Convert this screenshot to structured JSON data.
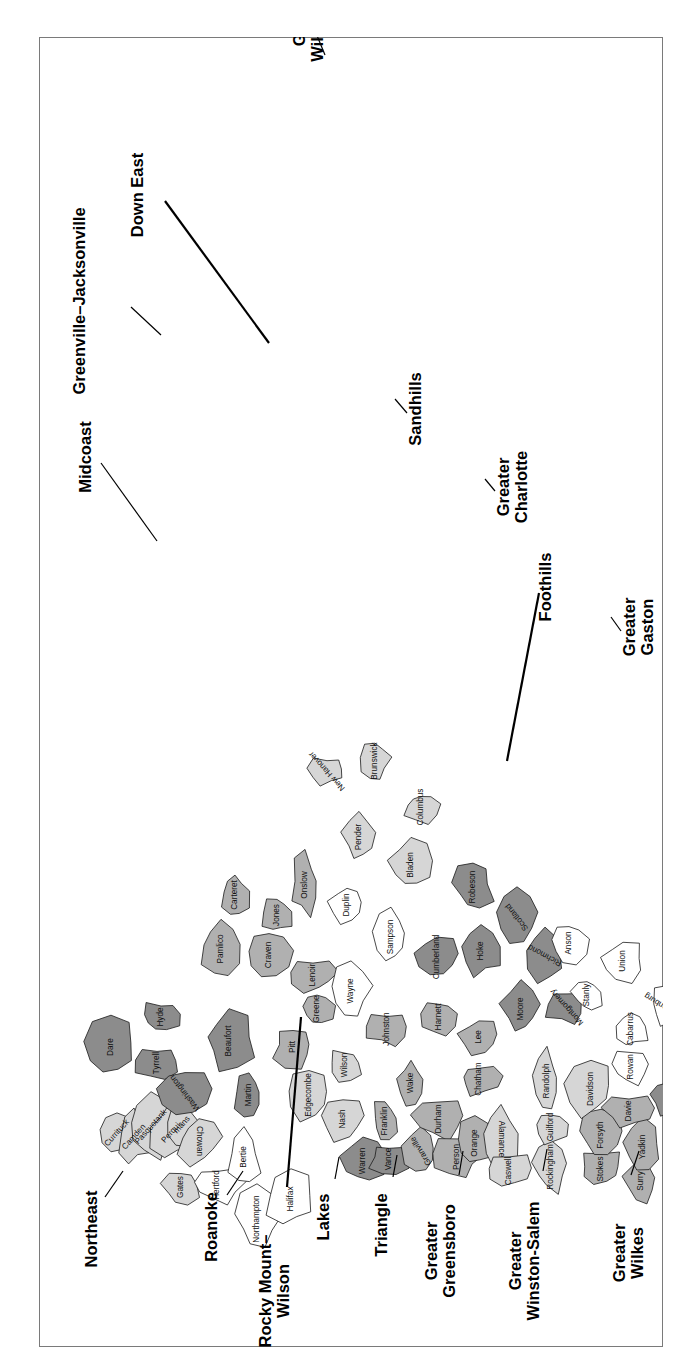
{
  "figure": {
    "kind": "choropleth-region-map",
    "orientation_degrees": -90,
    "frame_border_color": "#7a7a7a"
  },
  "palette": {
    "white": "#ffffff",
    "light_gray": "#d6d6d6",
    "medium_gray": "#b0b0b0",
    "dark_gray": "#8c8c8c",
    "darkest_gray": "#7a7a7a",
    "outline": "#1a1a1a",
    "text": "#111111"
  },
  "regions": [
    {
      "id": "northeast",
      "label": "Northeast",
      "label_x": 118,
      "label_y": 58,
      "leader": [
        [
          150,
          66
        ],
        [
          176,
          84
        ]
      ],
      "tone": "light_gray"
    },
    {
      "id": "midcoast",
      "label": "Midcoast",
      "label_x": 890,
      "label_y": 52,
      "leader": [
        [
          884,
          62
        ],
        [
          806,
          118
        ]
      ],
      "tone": "dark_gray"
    },
    {
      "id": "greenville-jacksonville",
      "label": "Greenville–Jacksonville",
      "label_x": 1046,
      "label_y": 46,
      "leader": [
        [
          1040,
          92
        ],
        [
          1012,
          122
        ]
      ],
      "tone": "medium_gray"
    },
    {
      "id": "down-east",
      "label": "Down East",
      "label_x": 1152,
      "label_y": 104,
      "leader": [
        [
          1146,
          126
        ],
        [
          1004,
          230
        ]
      ],
      "tone": "medium_gray"
    },
    {
      "id": "greater-wilmington",
      "label": "Greater Wilmington",
      "label_x": 1330,
      "label_y": 266,
      "leader": [
        [
          1326,
          272
        ],
        [
          1292,
          286
        ]
      ],
      "tone": "light_gray"
    },
    {
      "id": "roanoke",
      "label": "Roanoke",
      "label_x": 120,
      "label_y": 178,
      "leader": [
        [
          152,
          188
        ],
        [
          176,
          204
        ]
      ],
      "tone": "white"
    },
    {
      "id": "rocky-mount-wilson",
      "label": "Rocky Mount–Wilson",
      "label_x": 56,
      "label_y": 232,
      "leader": [
        [
          160,
          248
        ],
        [
          330,
          262
        ]
      ],
      "tone": "light_gray"
    },
    {
      "id": "lakes",
      "label": "Lakes",
      "label_x": 130,
      "label_y": 290,
      "leader": [
        [
          168,
          296
        ],
        [
          190,
          300
        ]
      ],
      "tone": "dark_gray"
    },
    {
      "id": "triangle",
      "label": "Triangle",
      "label_x": 122,
      "label_y": 348,
      "leader": [
        [
          170,
          354
        ],
        [
          192,
          358
        ]
      ],
      "tone": "medium_gray"
    },
    {
      "id": "greater-greensboro",
      "label": "Greater Greensboro",
      "label_x": 96,
      "label_y": 398,
      "leader": [
        [
          172,
          420
        ],
        [
          196,
          424
        ]
      ],
      "tone": "light_gray"
    },
    {
      "id": "greater-winston-salem",
      "label": "Greater Winston-Salem",
      "label_x": 86,
      "label_y": 482,
      "leader": [
        [
          176,
          504
        ],
        [
          198,
          508
        ]
      ],
      "tone": "medium_gray"
    },
    {
      "id": "greater-wilkes",
      "label": "Greater Wilkes",
      "label_x": 94,
      "label_y": 586,
      "leader": [
        [
          172,
          592
        ],
        [
          196,
          600
        ]
      ],
      "tone": "light_gray"
    },
    {
      "id": "greater-boone",
      "label": "Greater Boone",
      "label_x": 158,
      "label_y": 660,
      "leader": [
        [
          250,
          654
        ],
        [
          272,
          640
        ]
      ],
      "tone": "medium_gray"
    },
    {
      "id": "greater-mountain",
      "label": "Greater Mountain",
      "label_x": 242,
      "label_y": 708,
      "leader": [
        [
          346,
          700
        ],
        [
          360,
          690
        ]
      ],
      "tone": "medium_gray"
    },
    {
      "id": "highlands",
      "label": "Highlands",
      "label_x": 472,
      "label_y": 794,
      "leader": [
        [
          538,
          782
        ],
        [
          560,
          766
        ]
      ],
      "tone": "white"
    },
    {
      "id": "far-west",
      "label": "Far West",
      "label_x": 800,
      "label_y": 822,
      "leader": [
        [
          772,
          806
        ],
        [
          786,
          794
        ]
      ],
      "tone": "light_gray"
    },
    {
      "id": "greater-asheville",
      "label": "Greater Asheville",
      "label_x": 700,
      "label_y": 700,
      "leader": [
        [
          700,
          682
        ],
        [
          716,
          668
        ]
      ],
      "tone": "medium_gray"
    },
    {
      "id": "greater-gaston",
      "label": "Greater Gaston",
      "label_x": 720,
      "label_y": 596,
      "leader": [
        [
          716,
          582
        ],
        [
          730,
          572
        ]
      ],
      "tone": "light_gray"
    },
    {
      "id": "foothills",
      "label": "Foothills",
      "label_x": 760,
      "label_y": 512,
      "leader": [
        [
          754,
          500
        ],
        [
          586,
          468
        ]
      ],
      "tone": "medium_gray"
    },
    {
      "id": "greater-charlotte",
      "label": "Greater Charlotte",
      "label_x": 860,
      "label_y": 470,
      "leader": [
        [
          856,
          456
        ],
        [
          868,
          446
        ]
      ],
      "tone": "white"
    },
    {
      "id": "sandhills",
      "label": "Sandhills",
      "label_x": 938,
      "label_y": 382,
      "leader": [
        [
          934,
          368
        ],
        [
          948,
          356
        ]
      ],
      "tone": "dark_gray"
    }
  ],
  "counties": [
    {
      "n": "Currituck",
      "x": 214,
      "y": 78,
      "tone": "light_gray",
      "rot": 42
    },
    {
      "n": "Camden",
      "x": 210,
      "y": 95,
      "tone": "light_gray",
      "rot": 42
    },
    {
      "n": "Pasquotank",
      "x": 220,
      "y": 112,
      "tone": "light_gray",
      "rot": 42
    },
    {
      "n": "Perqui-",
      "x": 215,
      "y": 133,
      "tone": "light_gray",
      "rot": 42
    },
    {
      "n": "mans",
      "x": 222,
      "y": 143,
      "tone": "light_gray",
      "rot": 42
    },
    {
      "n": "Chowan",
      "x": 206,
      "y": 160,
      "tone": "light_gray",
      "rot": 180
    },
    {
      "n": "Gates",
      "x": 160,
      "y": 142,
      "tone": "light_gray",
      "rot": 0
    },
    {
      "n": "Hertford",
      "x": 162,
      "y": 178,
      "tone": "white",
      "rot": 0
    },
    {
      "n": "Bertie",
      "x": 190,
      "y": 205,
      "tone": "white",
      "rot": 0
    },
    {
      "n": "Northampton",
      "x": 128,
      "y": 218,
      "tone": "white",
      "rot": 0
    },
    {
      "n": "Halifax",
      "x": 148,
      "y": 252,
      "tone": "white",
      "rot": 0
    },
    {
      "n": "Dare",
      "x": 300,
      "y": 72,
      "tone": "dark_gray",
      "rot": 0
    },
    {
      "n": "Tyrrell",
      "x": 284,
      "y": 118,
      "tone": "dark_gray",
      "rot": 0
    },
    {
      "n": "Hyde",
      "x": 330,
      "y": 122,
      "tone": "dark_gray",
      "rot": 0
    },
    {
      "n": "Washington",
      "x": 254,
      "y": 146,
      "tone": "dark_gray",
      "rot": -38
    },
    {
      "n": "Beaufort",
      "x": 306,
      "y": 190,
      "tone": "dark_gray",
      "rot": 0
    },
    {
      "n": "Martin",
      "x": 252,
      "y": 210,
      "tone": "dark_gray",
      "rot": 0
    },
    {
      "n": "Pamlico",
      "x": 398,
      "y": 182,
      "tone": "medium_gray",
      "rot": 0
    },
    {
      "n": "Carteret",
      "x": 452,
      "y": 196,
      "tone": "medium_gray",
      "rot": 0
    },
    {
      "n": "Craven",
      "x": 392,
      "y": 230,
      "tone": "medium_gray",
      "rot": 0
    },
    {
      "n": "Jones",
      "x": 432,
      "y": 238,
      "tone": "medium_gray",
      "rot": 0
    },
    {
      "n": "Onslow",
      "x": 462,
      "y": 266,
      "tone": "medium_gray",
      "rot": 0
    },
    {
      "n": "Pitt",
      "x": 300,
      "y": 254,
      "tone": "medium_gray",
      "rot": 0
    },
    {
      "n": "Greene",
      "x": 338,
      "y": 278,
      "tone": "medium_gray",
      "rot": 0
    },
    {
      "n": "Lenoir",
      "x": 372,
      "y": 274,
      "tone": "medium_gray",
      "rot": 0
    },
    {
      "n": "Edgecombe",
      "x": 252,
      "y": 270,
      "tone": "light_gray",
      "rot": 0
    },
    {
      "n": "Nash",
      "x": 228,
      "y": 304,
      "tone": "light_gray",
      "rot": 0
    },
    {
      "n": "Wilson",
      "x": 282,
      "y": 306,
      "tone": "light_gray",
      "rot": 0
    },
    {
      "n": "Wayne",
      "x": 356,
      "y": 312,
      "tone": "white",
      "rot": 0
    },
    {
      "n": "Duplin",
      "x": 442,
      "y": 308,
      "tone": "white",
      "rot": 0
    },
    {
      "n": "Sampson",
      "x": 410,
      "y": 352,
      "tone": "white",
      "rot": 0
    },
    {
      "n": "Pender",
      "x": 510,
      "y": 320,
      "tone": "light_gray",
      "rot": 0
    },
    {
      "n": "New Hanover",
      "x": 576,
      "y": 288,
      "tone": "light_gray",
      "rot": -42
    },
    {
      "n": "Brunswick",
      "x": 586,
      "y": 336,
      "tone": "light_gray",
      "rot": 0
    },
    {
      "n": "Columbus",
      "x": 540,
      "y": 382,
      "tone": "light_gray",
      "rot": 0
    },
    {
      "n": "Bladen",
      "x": 482,
      "y": 372,
      "tone": "light_gray",
      "rot": 0
    },
    {
      "n": "Warren",
      "x": 186,
      "y": 324,
      "tone": "dark_gray",
      "rot": 0
    },
    {
      "n": "Vance",
      "x": 188,
      "y": 350,
      "tone": "dark_gray",
      "rot": 0
    },
    {
      "n": "Granville",
      "x": 196,
      "y": 382,
      "tone": "medium_gray",
      "rot": -32
    },
    {
      "n": "Franklin",
      "x": 226,
      "y": 346,
      "tone": "medium_gray",
      "rot": 0
    },
    {
      "n": "Johnston",
      "x": 318,
      "y": 348,
      "tone": "medium_gray",
      "rot": 0
    },
    {
      "n": "Wake",
      "x": 264,
      "y": 372,
      "tone": "medium_gray",
      "rot": 0
    },
    {
      "n": "Durham",
      "x": 228,
      "y": 400,
      "tone": "medium_gray",
      "rot": 0
    },
    {
      "n": "Person",
      "x": 190,
      "y": 418,
      "tone": "medium_gray",
      "rot": 0
    },
    {
      "n": "Orange",
      "x": 204,
      "y": 436,
      "tone": "medium_gray",
      "rot": 0
    },
    {
      "n": "Alamance",
      "x": 208,
      "y": 462,
      "tone": "light_gray",
      "rot": 180
    },
    {
      "n": "Chatham",
      "x": 268,
      "y": 440,
      "tone": "medium_gray",
      "rot": 0
    },
    {
      "n": "Harnett",
      "x": 330,
      "y": 400,
      "tone": "medium_gray",
      "rot": 0
    },
    {
      "n": "Lee",
      "x": 310,
      "y": 440,
      "tone": "medium_gray",
      "rot": 0
    },
    {
      "n": "Cumberland",
      "x": 390,
      "y": 398,
      "tone": "dark_gray",
      "rot": 0
    },
    {
      "n": "Hoke",
      "x": 396,
      "y": 442,
      "tone": "dark_gray",
      "rot": 0
    },
    {
      "n": "Robeson",
      "x": 460,
      "y": 434,
      "tone": "dark_gray",
      "rot": 0
    },
    {
      "n": "Scotland",
      "x": 430,
      "y": 478,
      "tone": "dark_gray",
      "rot": -38
    },
    {
      "n": "Moore",
      "x": 338,
      "y": 482,
      "tone": "dark_gray",
      "rot": 0
    },
    {
      "n": "Richmond",
      "x": 392,
      "y": 506,
      "tone": "dark_gray",
      "rot": -62
    },
    {
      "n": "Montgomery",
      "x": 340,
      "y": 528,
      "tone": "dark_gray",
      "rot": -42
    },
    {
      "n": "Caswell",
      "x": 176,
      "y": 470,
      "tone": "light_gray",
      "rot": 0
    },
    {
      "n": "Rockingham",
      "x": 180,
      "y": 512,
      "tone": "light_gray",
      "rot": 0
    },
    {
      "n": "Guilford",
      "x": 220,
      "y": 512,
      "tone": "light_gray",
      "rot": 0
    },
    {
      "n": "Randolph",
      "x": 266,
      "y": 508,
      "tone": "light_gray",
      "rot": 0
    },
    {
      "n": "Stokes",
      "x": 178,
      "y": 562,
      "tone": "medium_gray",
      "rot": 0
    },
    {
      "n": "Forsyth",
      "x": 212,
      "y": 562,
      "tone": "medium_gray",
      "rot": 0
    },
    {
      "n": "Davidson",
      "x": 258,
      "y": 552,
      "tone": "light_gray",
      "rot": 0
    },
    {
      "n": "Surry",
      "x": 166,
      "y": 602,
      "tone": "medium_gray",
      "rot": 0
    },
    {
      "n": "Yadkin",
      "x": 200,
      "y": 604,
      "tone": "medium_gray",
      "rot": 0
    },
    {
      "n": "Davie",
      "x": 236,
      "y": 590,
      "tone": "medium_gray",
      "rot": 0
    },
    {
      "n": "Rowan",
      "x": 280,
      "y": 592,
      "tone": "white",
      "rot": 0
    },
    {
      "n": "Stanly",
      "x": 352,
      "y": 548,
      "tone": "white",
      "rot": 0
    },
    {
      "n": "Anson",
      "x": 404,
      "y": 530,
      "tone": "white",
      "rot": 0
    },
    {
      "n": "Cabarrus",
      "x": 318,
      "y": 592,
      "tone": "white",
      "rot": 0
    },
    {
      "n": "Union",
      "x": 386,
      "y": 584,
      "tone": "white",
      "rot": 0
    },
    {
      "n": "Mecklenburg",
      "x": 340,
      "y": 626,
      "tone": "white",
      "rot": -58
    },
    {
      "n": "Alleghany",
      "x": 146,
      "y": 644,
      "tone": "light_gray",
      "rot": -42
    },
    {
      "n": "Wilkes",
      "x": 180,
      "y": 658,
      "tone": "light_gray",
      "rot": 0
    },
    {
      "n": "Ashe",
      "x": 140,
      "y": 684,
      "tone": "light_gray",
      "rot": 0
    },
    {
      "n": "Iredell",
      "x": 250,
      "y": 630,
      "tone": "dark_gray",
      "rot": 0
    },
    {
      "n": "Alexander",
      "x": 236,
      "y": 658,
      "tone": "dark_gray",
      "rot": -50
    },
    {
      "n": "Catawba",
      "x": 270,
      "y": 666,
      "tone": "dark_gray",
      "rot": 0
    },
    {
      "n": "Caldwell",
      "x": 226,
      "y": 700,
      "tone": "darkest_gray",
      "rot": 0
    },
    {
      "n": "Watauga",
      "x": 178,
      "y": 706,
      "tone": "medium_gray",
      "rot": 0
    },
    {
      "n": "Avery",
      "x": 202,
      "y": 734,
      "tone": "medium_gray",
      "rot": 0
    },
    {
      "n": "Lincoln",
      "x": 306,
      "y": 664,
      "tone": "light_gray",
      "rot": 0
    },
    {
      "n": "Gaston",
      "x": 336,
      "y": 666,
      "tone": "light_gray",
      "rot": 0
    },
    {
      "n": "Cleveland",
      "x": 344,
      "y": 700,
      "tone": "light_gray",
      "rot": 0
    },
    {
      "n": "Burke",
      "x": 268,
      "y": 714,
      "tone": "white",
      "rot": 0
    },
    {
      "n": "McDowell",
      "x": 282,
      "y": 756,
      "tone": "white",
      "rot": 0
    },
    {
      "n": "Rutherford",
      "x": 324,
      "y": 740,
      "tone": "light_gray",
      "rot": 0
    },
    {
      "n": "Polk",
      "x": 352,
      "y": 768,
      "tone": "light_gray",
      "rot": 0
    },
    {
      "n": "Mitchell",
      "x": 222,
      "y": 766,
      "tone": "white",
      "rot": 0
    },
    {
      "n": "Yancey",
      "x": 244,
      "y": 786,
      "tone": "white",
      "rot": 0
    },
    {
      "n": "Madison",
      "x": 238,
      "y": 822,
      "tone": "medium_gray",
      "rot": 0
    },
    {
      "n": "Buncombe",
      "x": 292,
      "y": 802,
      "tone": "medium_gray",
      "rot": 0
    },
    {
      "n": "Henderson",
      "x": 334,
      "y": 800,
      "tone": "medium_gray",
      "rot": 0
    },
    {
      "n": "Transylvania",
      "x": 368,
      "y": 828,
      "tone": "medium_gray",
      "rot": 180
    },
    {
      "n": "Haywood",
      "x": 294,
      "y": 850,
      "tone": "medium_gray",
      "rot": 0
    },
    {
      "n": "Jackson",
      "x": 330,
      "y": 878,
      "tone": "white",
      "rot": 0
    },
    {
      "n": "Swain",
      "x": 290,
      "y": 906,
      "tone": "white",
      "rot": 0
    },
    {
      "n": "Macon",
      "x": 354,
      "y": 912,
      "tone": "light_gray",
      "rot": 0
    },
    {
      "n": "Graham",
      "x": 306,
      "y": 948,
      "tone": "white",
      "rot": 0
    },
    {
      "n": "Clay",
      "x": 374,
      "y": 946,
      "tone": "light_gray",
      "rot": 0
    },
    {
      "n": "Cherokee",
      "x": 340,
      "y": 980,
      "tone": "light_gray",
      "rot": 0
    }
  ],
  "chart_data": {
    "type": "map",
    "title": "",
    "legend": [],
    "category_count": 100,
    "region_count": 21
  }
}
